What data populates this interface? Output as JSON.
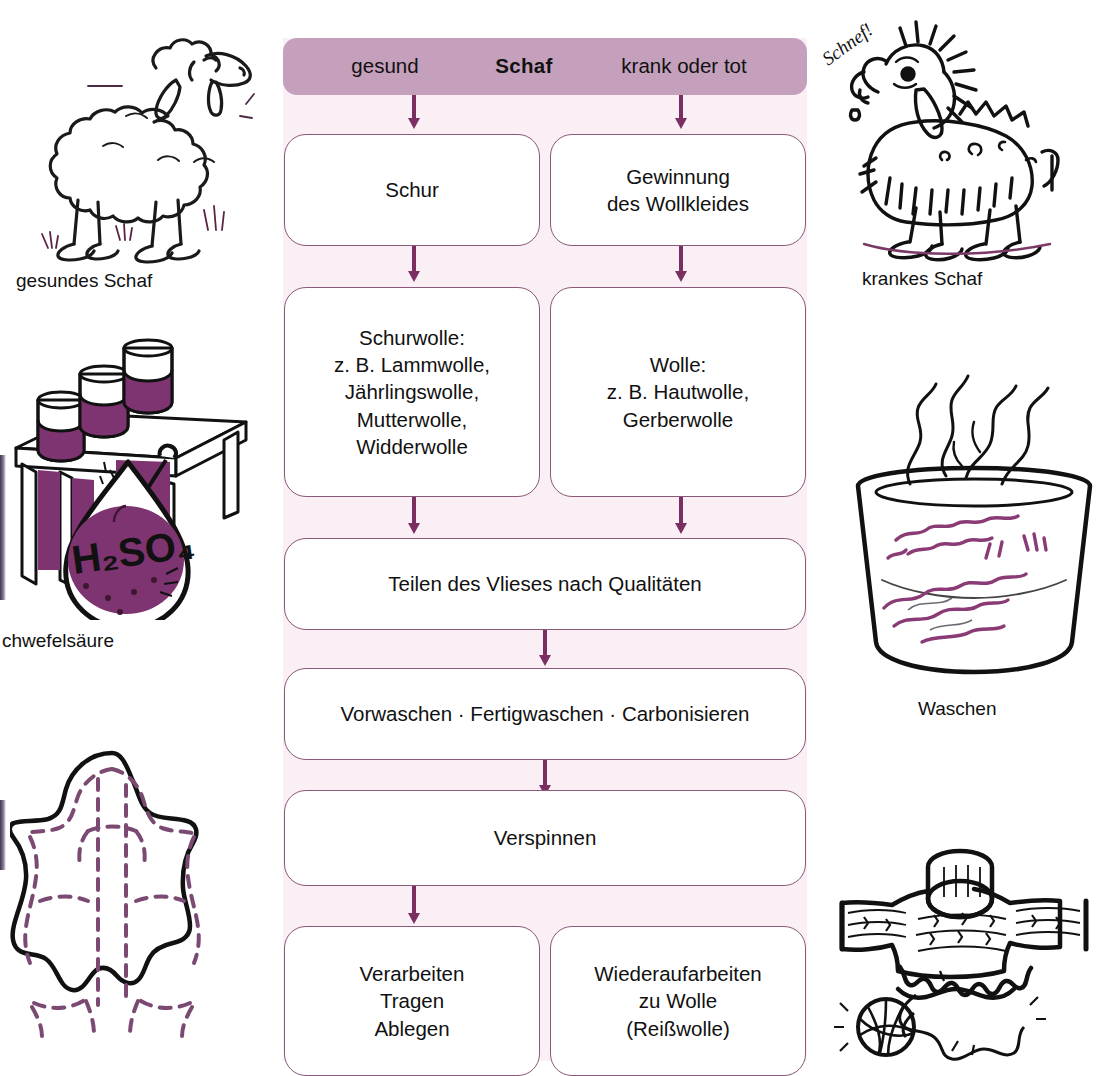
{
  "flowchart": {
    "header": {
      "left_label": "gesund",
      "center_label": "Schaf",
      "right_label": "krank oder tot"
    },
    "nodes": [
      {
        "id": "schur",
        "lines": [
          "Schur"
        ]
      },
      {
        "id": "gewinnung",
        "lines": [
          "Gewinnung",
          "des Wollkleides"
        ]
      },
      {
        "id": "schurwolle",
        "lines": [
          "Schurwolle:",
          "z. B. Lammwolle,",
          "Jährlingswolle,",
          "Mutterwolle,",
          "Widderwolle"
        ]
      },
      {
        "id": "wolle",
        "lines": [
          "Wolle:",
          "z. B. Hautwolle,",
          "Gerberwolle"
        ]
      },
      {
        "id": "teilen",
        "lines": [
          "Teilen des Vlieses nach Qualitäten"
        ]
      },
      {
        "id": "waschen",
        "lines": [
          "Vorwaschen · Fertigwaschen · Carbonisieren"
        ]
      },
      {
        "id": "verspinnen",
        "lines": [
          "Verspinnen"
        ]
      },
      {
        "id": "verarbeiten",
        "lines": [
          "Verarbeiten",
          "Tragen",
          "Ablegen"
        ]
      },
      {
        "id": "wiederaufarbeiten",
        "lines": [
          "Wiederaufarbeiten",
          "zu Wolle",
          "(Reißwolle)"
        ]
      }
    ],
    "colors": {
      "header_fill": "#c4a0bc",
      "panel_background": "#f9eff5",
      "box_border": "#8a5878",
      "arrow": "#7a2e61",
      "text": "#111111"
    }
  },
  "illustrations": {
    "healthy_sheep": {
      "caption": "gesundes Schaf",
      "icon": "healthy-sheep-drawing"
    },
    "sick_sheep": {
      "caption": "krankes Schaf",
      "sound_word": "Schnef!",
      "icon": "sick-sheep-drawing"
    },
    "sulfuric_acid": {
      "caption": "chwefelsäure",
      "formula": "H₂SO₄",
      "icon": "test-tube-rack-and-flask-drawing"
    },
    "washing": {
      "caption": "Waschen",
      "icon": "steaming-bowl-of-wool-drawing"
    },
    "hide": {
      "caption": "",
      "icon": "animal-hide-cutting-pattern-drawing"
    },
    "sweater": {
      "caption": "",
      "icon": "unravelling-sweater-and-yarn-ball-drawing"
    }
  }
}
